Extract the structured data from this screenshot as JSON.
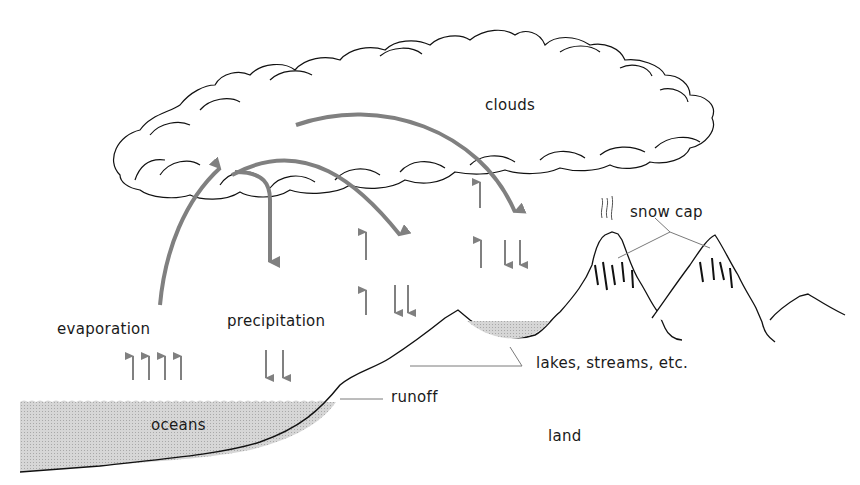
{
  "diagram": {
    "labels": {
      "clouds": "clouds",
      "evaporation": "evaporation",
      "precipitation": "precipitation",
      "snow_cap": "snow cap",
      "lakes": "lakes, streams, etc.",
      "runoff": "runoff",
      "oceans": "oceans",
      "land": "land"
    },
    "colors": {
      "arrow": "#808080",
      "water_fill": "#c8c8c8",
      "outline": "#111111",
      "leader": "#7a7a7a"
    }
  }
}
